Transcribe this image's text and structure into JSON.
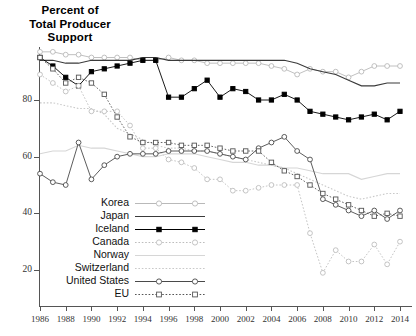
{
  "title": {
    "line1": "Percent of",
    "line2": "Total Producer",
    "line3": "Support"
  },
  "axes": {
    "y_ticks": [
      20,
      40,
      60,
      80
    ],
    "y_tick_labels": [
      "20",
      "40",
      "60",
      "80"
    ],
    "x_ticks": [
      1986,
      1988,
      1990,
      1992,
      1994,
      1996,
      1998,
      2000,
      2002,
      2004,
      2006,
      2008,
      2010,
      2012,
      2014
    ],
    "x_tick_labels": [
      "1986",
      "1988",
      "1990",
      "1992",
      "1994",
      "1996",
      "1998",
      "2000",
      "2002",
      "2004",
      "2006",
      "2008",
      "2010",
      "2012",
      "2014"
    ]
  },
  "legend": {
    "position": "inside-lower-left",
    "entries": [
      {
        "label": "Korea",
        "marker": "open-circle",
        "dash": "solid",
        "color": "#b9b9b9"
      },
      {
        "label": "Japan",
        "marker": "none",
        "dash": "solid",
        "color": "#3a3a3a"
      },
      {
        "label": "Iceland",
        "marker": "filled-square",
        "dash": "solid",
        "color": "#000000"
      },
      {
        "label": "Canada",
        "marker": "open-circle",
        "dash": "dotted",
        "color": "#bdbdbd"
      },
      {
        "label": "Norway",
        "marker": "none",
        "dash": "solid",
        "color": "#d6d6d6"
      },
      {
        "label": "Switzerland",
        "marker": "none",
        "dash": "dotted",
        "color": "#c9c9c9"
      },
      {
        "label": "United States",
        "marker": "open-circle",
        "dash": "solid",
        "color": "#4a4a4a"
      },
      {
        "label": "EU",
        "marker": "open-square",
        "dash": "dotted",
        "color": "#555555"
      }
    ]
  },
  "chart_data": {
    "type": "line",
    "title": "Percent of Total Producer Support",
    "xlabel": "",
    "ylabel": "Percent of Total Producer Support",
    "xlim": [
      1986,
      2014
    ],
    "ylim": [
      10,
      100
    ],
    "grid": false,
    "x": [
      1986,
      1987,
      1988,
      1989,
      1990,
      1991,
      1992,
      1993,
      1994,
      1995,
      1996,
      1997,
      1998,
      1999,
      2000,
      2001,
      2002,
      2003,
      2004,
      2005,
      2006,
      2007,
      2008,
      2009,
      2010,
      2011,
      2012,
      2013,
      2014
    ],
    "series": [
      {
        "name": "Korea",
        "marker": "open-circle",
        "dash": "solid",
        "color": "#b9b9b9",
        "values": [
          97,
          97,
          96,
          96,
          95,
          95,
          95,
          95,
          94,
          94,
          95,
          94,
          94,
          93,
          93,
          93,
          93,
          93,
          92,
          91,
          89,
          91,
          90,
          90,
          88,
          90,
          92,
          92,
          92
        ]
      },
      {
        "name": "Japan",
        "marker": "none",
        "dash": "solid",
        "color": "#3a3a3a",
        "values": [
          94,
          94,
          93,
          93,
          94,
          94,
          94,
          94,
          95,
          95,
          94,
          94,
          94,
          94,
          94,
          94,
          94,
          94,
          94,
          94,
          93,
          91,
          90,
          89,
          87,
          85,
          85,
          86,
          86
        ]
      },
      {
        "name": "Iceland",
        "marker": "filled-square",
        "dash": "solid",
        "color": "#000000",
        "values": [
          95,
          92,
          88,
          85,
          90,
          91,
          92,
          93,
          94,
          94,
          81,
          81,
          84,
          87,
          81,
          84,
          83,
          80,
          80,
          82,
          80,
          76,
          75,
          74,
          73,
          74,
          75,
          73,
          76
        ]
      },
      {
        "name": "Canada",
        "marker": "open-circle",
        "dash": "dotted",
        "color": "#bdbdbd",
        "values": [
          89,
          86,
          83,
          85,
          76,
          76,
          76,
          71,
          63,
          63,
          59,
          58,
          56,
          52,
          52,
          48,
          48,
          49,
          50,
          50,
          50,
          33,
          19,
          27,
          23,
          23,
          29,
          22,
          30
        ]
      },
      {
        "name": "Norway",
        "marker": "none",
        "dash": "solid",
        "color": "#d6d6d6",
        "values": [
          61,
          62,
          62,
          64,
          63,
          63,
          62,
          61,
          60,
          60,
          61,
          61,
          61,
          60,
          59,
          58,
          58,
          57,
          57,
          56,
          56,
          55,
          54,
          54,
          54,
          52,
          53,
          54,
          54
        ]
      },
      {
        "name": "Switzerland",
        "marker": "none",
        "dash": "dotted",
        "color": "#c9c9c9",
        "values": [
          79,
          79,
          78,
          77,
          77,
          75,
          70,
          68,
          66,
          64,
          63,
          63,
          62,
          62,
          61,
          60,
          59,
          58,
          57,
          56,
          54,
          52,
          50,
          48,
          46,
          45,
          46,
          47,
          47
        ]
      },
      {
        "name": "United States",
        "marker": "open-circle",
        "dash": "solid",
        "color": "#4a4a4a",
        "values": [
          54,
          51,
          50,
          65,
          52,
          57,
          60,
          61,
          61,
          61,
          62,
          62,
          62,
          62,
          61,
          60,
          59,
          63,
          65,
          67,
          62,
          59,
          45,
          43,
          41,
          39,
          41,
          38,
          41
        ]
      },
      {
        "name": "EU",
        "marker": "open-square",
        "dash": "dotted",
        "color": "#555555",
        "values": [
          95,
          91,
          86,
          88,
          86,
          82,
          74,
          67,
          65,
          65,
          65,
          64,
          64,
          64,
          63,
          62,
          62,
          62,
          58,
          55,
          53,
          50,
          47,
          45,
          43,
          41,
          39,
          40,
          39
        ]
      }
    ]
  }
}
